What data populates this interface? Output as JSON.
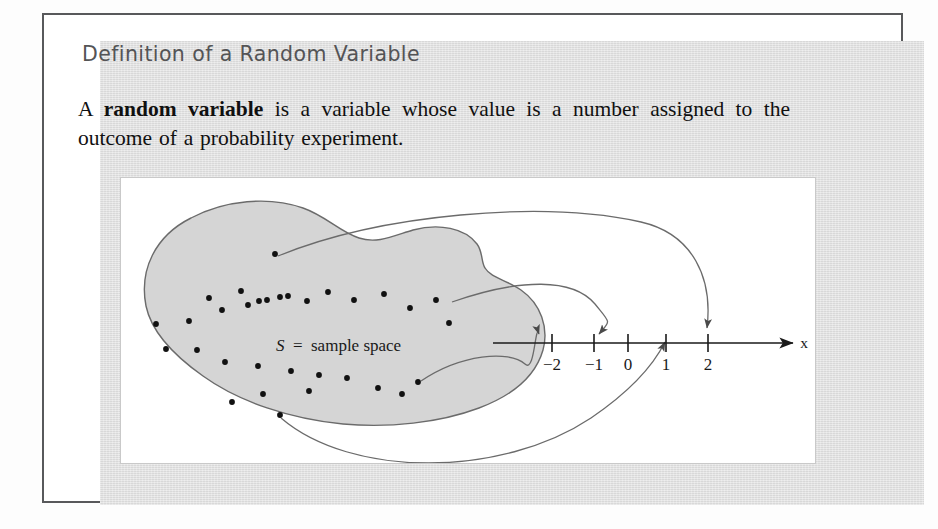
{
  "heading": "Definition of a Random Variable",
  "definition": {
    "lead": "A ",
    "term": "random variable",
    "rest": " is a variable whose value is a number assigned to the outcome of a probability experiment."
  },
  "diagram": {
    "sample_space_label_symbol": "S",
    "sample_space_label_equals": "=",
    "sample_space_label_text": "sample space",
    "axis": {
      "variable_label": "x",
      "ticks": [
        {
          "label": "−2",
          "value": -2,
          "x": 551
        },
        {
          "label": "−1",
          "value": -1,
          "x": 593
        },
        {
          "label": "0",
          "value": 0,
          "x": 627
        },
        {
          "label": "1",
          "value": 1,
          "x": 665
        },
        {
          "label": "2",
          "value": 2,
          "x": 707
        }
      ],
      "line_start_x": 492,
      "line_end_x": 796,
      "line_y": 342
    },
    "mappings": [
      {
        "from_dot": "top-dot",
        "to_tick_label": "2",
        "arc": "upper-long"
      },
      {
        "from_dot": "right-upper-dot",
        "to_tick_label": "−1",
        "arc": "middle"
      },
      {
        "from_dot": "right-mid-dot",
        "to_tick_label": "−2",
        "arc": "lower-short"
      },
      {
        "from_dot": "bottom-dot",
        "to_tick_label": "1",
        "arc": "under-loop"
      }
    ],
    "sample_points": [
      [
        274,
        253
      ],
      [
        208,
        297
      ],
      [
        240,
        290
      ],
      [
        258,
        300
      ],
      [
        266,
        299
      ],
      [
        287,
        295
      ],
      [
        155,
        323
      ],
      [
        188,
        320
      ],
      [
        221,
        309
      ],
      [
        247,
        304
      ],
      [
        279,
        296
      ],
      [
        306,
        300
      ],
      [
        327,
        291
      ],
      [
        353,
        299
      ],
      [
        383,
        293
      ],
      [
        409,
        307
      ],
      [
        435,
        299
      ],
      [
        448,
        322
      ],
      [
        165,
        348
      ],
      [
        196,
        349
      ],
      [
        224,
        361
      ],
      [
        257,
        365
      ],
      [
        290,
        370
      ],
      [
        318,
        374
      ],
      [
        346,
        377
      ],
      [
        377,
        387
      ],
      [
        401,
        393
      ],
      [
        417,
        381
      ],
      [
        262,
        393
      ],
      [
        231,
        401
      ],
      [
        308,
        390
      ],
      [
        279,
        414
      ]
    ],
    "colors": {
      "card_background": "#dedede",
      "panel_background": "#ffffff",
      "blob_fill": "#d5d5d5",
      "blob_stroke": "#6b6b6b",
      "dot_color": "#111111",
      "axis_color": "#1a1a1a",
      "heading_color": "#545456",
      "frame_color": "#58595b"
    }
  }
}
